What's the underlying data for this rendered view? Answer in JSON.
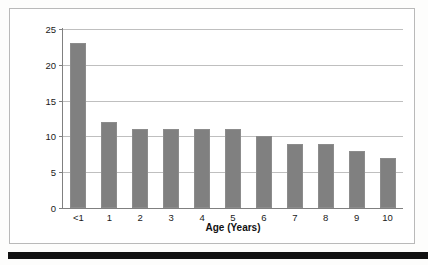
{
  "chart_data": {
    "type": "bar",
    "title": "",
    "subtitle": "",
    "xlabel": "Age (Years)",
    "ylabel": "Rate per 1,000 Children",
    "categories": [
      "<1",
      "1",
      "2",
      "3",
      "4",
      "5",
      "6",
      "7",
      "8",
      "9",
      "10"
    ],
    "values": [
      23,
      12,
      11,
      11,
      11,
      11,
      10,
      9,
      9,
      8,
      7
    ],
    "series": [
      {
        "name": "Rate per 1,000 Children",
        "values": [
          23,
          12,
          11,
          11,
          11,
          11,
          10,
          9,
          9,
          8,
          7
        ]
      }
    ],
    "ylim": [
      0,
      25
    ],
    "yticks": [
      0,
      5,
      10,
      15,
      20,
      25
    ],
    "ytick_labels": [
      "0",
      "5",
      "10",
      "15",
      "20",
      "25"
    ],
    "grid": true,
    "grid_axis": "y",
    "legend": false,
    "legend_position": "none",
    "bar_color": "#808080",
    "grid_color": "#bfbfbf",
    "axis_color": "#808080",
    "plot_background": "#ffffff",
    "frame_border_color": "#b9b9b9"
  },
  "page": {
    "bottom_rule_color": "#111111"
  }
}
